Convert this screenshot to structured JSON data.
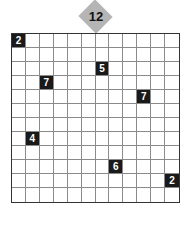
{
  "puzzle": {
    "size_badge": "12",
    "rows": 12,
    "cols": 12,
    "clues": [
      {
        "row": 0,
        "col": 0,
        "value": "2"
      },
      {
        "row": 2,
        "col": 6,
        "value": "5"
      },
      {
        "row": 3,
        "col": 2,
        "value": "7"
      },
      {
        "row": 4,
        "col": 9,
        "value": "7"
      },
      {
        "row": 7,
        "col": 1,
        "value": "4"
      },
      {
        "row": 9,
        "col": 7,
        "value": "6"
      },
      {
        "row": 10,
        "col": 11,
        "value": "2"
      }
    ]
  },
  "colors": {
    "badge_bg": "#b5b5b5",
    "clue_bg": "#1a1a1a",
    "clue_text": "#ffffff",
    "grid_line": "#8a8a8a",
    "grid_border": "#333333"
  }
}
